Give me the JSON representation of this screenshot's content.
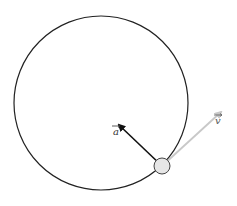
{
  "diagram": {
    "path": {
      "cx": 101,
      "cy": 103,
      "r": 87,
      "color": "#222222"
    },
    "body": {
      "cx": 162,
      "cy": 166,
      "r": 8,
      "fill": "#e6e6e6",
      "stroke": "#444444"
    },
    "vectors": {
      "acceleration": {
        "label": "a",
        "from": [
          162,
          166
        ],
        "to": [
          118,
          124
        ],
        "color": "#111111"
      },
      "velocity": {
        "label": "v",
        "from": [
          162,
          166
        ],
        "to": [
          222,
          111
        ],
        "color": "#c8c8c8"
      }
    },
    "labels": {
      "a": {
        "text": "a",
        "x": 113,
        "y": 134
      },
      "v": {
        "text": "v",
        "x": 215,
        "y": 124
      }
    }
  }
}
